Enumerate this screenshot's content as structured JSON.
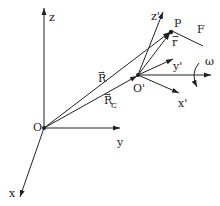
{
  "diagram": {
    "type": "rotating-reference-frame",
    "colors": {
      "ink": "#222222",
      "background": "#ffffff"
    },
    "origin_fixed": {
      "label": "O"
    },
    "origin_moving": {
      "label": "O'"
    },
    "point": {
      "label": "P"
    },
    "fixed_axes": {
      "x": "x",
      "y": "y",
      "z": "z"
    },
    "moving_axes": {
      "x": "x'",
      "y": "y'",
      "z": "z'"
    },
    "vectors": {
      "R": {
        "label": "R",
        "arrow": "→"
      },
      "Rc": {
        "label": "R",
        "subscript": "C",
        "arrow": "→"
      },
      "r": {
        "label": "r",
        "arrow": "→"
      }
    },
    "force": {
      "label": "F"
    },
    "angular_velocity": {
      "label": "ω"
    }
  }
}
